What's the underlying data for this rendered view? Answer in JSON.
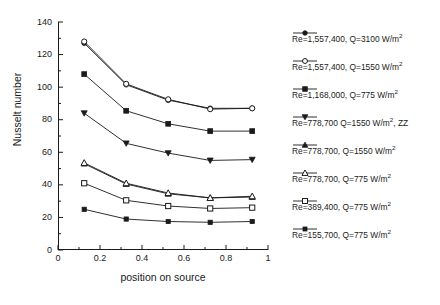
{
  "chart_data": {
    "type": "line",
    "title": "",
    "xlabel": "position on source",
    "ylabel": "Nusselt number",
    "xlim": [
      0,
      1
    ],
    "ylim": [
      0,
      140
    ],
    "x_ticks": [
      "0",
      "0.2",
      "0.4",
      "0.6",
      "0.8",
      "1"
    ],
    "x_tick_values": [
      0,
      0.2,
      0.4,
      0.6,
      0.8,
      1
    ],
    "y_ticks": [
      "0",
      "20",
      "40",
      "60",
      "80",
      "100",
      "120",
      "140"
    ],
    "y_tick_values": [
      0,
      20,
      40,
      60,
      80,
      100,
      120,
      140
    ],
    "x_minor_step": 0.1,
    "y_minor_step": 10,
    "grid": false,
    "legend_position": "right",
    "x": [
      0.12,
      0.32,
      0.52,
      0.72,
      0.92
    ],
    "series": [
      {
        "name": "Re=1,557,400, Q=3100 W/m²",
        "marker": "filled-circle",
        "values": [
          127,
          101.5,
          92,
          87,
          87
        ]
      },
      {
        "name": "Re=1,557,400, Q=1550 W/m²",
        "marker": "open-circle",
        "values": [
          128,
          102,
          92.5,
          86.5,
          87
        ]
      },
      {
        "name": "Re=1,168,000, Q=775 W/m²",
        "marker": "filled-square",
        "values": [
          108,
          85.5,
          77.5,
          73,
          73
        ]
      },
      {
        "name": "Re=778,700 Q=1550 W/m², ZZ",
        "marker": "filled-down-triangle",
        "values": [
          84,
          65.5,
          59.5,
          55,
          55.5
        ]
      },
      {
        "name": "Re=778,700, Q=1550 W/m²",
        "marker": "filled-up-triangle",
        "values": [
          53,
          40.5,
          34.5,
          32,
          32.5
        ]
      },
      {
        "name": "Re=389,400, Q=775 W/m²",
        "marker": "open-up-triangle",
        "values": [
          53.5,
          41,
          35,
          32,
          33
        ]
      },
      {
        "name": "Re=155,700, Q=775 W/m²",
        "marker": "open-square",
        "values": [
          41,
          30.5,
          27,
          25.5,
          26
        ]
      },
      {
        "name": "Re=155,700. Q=581 W/m²",
        "marker": "filled-small-square",
        "values": [
          25,
          19,
          17.5,
          17,
          17.5
        ]
      }
    ]
  },
  "legend": {
    "entries": [
      {
        "label": "Re=1,557,400, Q=3100 W/m",
        "unit_sup": "2"
      },
      {
        "label": "Re=1,557,400, Q=1550 W/m",
        "unit_sup": "2"
      },
      {
        "label": "Re=1,168,000, Q=775 W/m",
        "unit_sup": "2"
      },
      {
        "label": "Re=778,700 Q=1550 W/m",
        "unit_sup": "2",
        "suffix": ", ZZ"
      },
      {
        "label": "Re=778,700, Q=1550 W/m",
        "unit_sup": "2"
      },
      {
        "label": "Re=778,700, Q=775 W/m",
        "unit_sup": "2"
      },
      {
        "label": "Re=389,400, Q=775 W/m",
        "unit_sup": "2"
      },
      {
        "label": "Re=155,700, Q=775 W/m",
        "unit_sup": "2"
      },
      {
        "label": "Re=155,700. Q=581 W/m",
        "unit_sup": "2"
      }
    ]
  },
  "colors": {
    "ink": "#1a1a1a",
    "background": "#ffffff"
  }
}
